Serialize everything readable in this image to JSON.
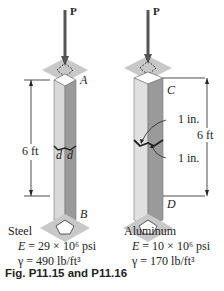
{
  "figure": {
    "caption": "Fig. P11.15 and P11.16",
    "colors": {
      "plate": "#c8c8c8",
      "column_light": "#d9d9d9",
      "column_dark": "#9a9a9a",
      "line": "#222222"
    }
  },
  "steel_column": {
    "load_label": "P",
    "top_point": "A",
    "bottom_point": "B",
    "length_label": "6 ft",
    "dimension_left": "d",
    "dimension_right": "d",
    "material": "Steel",
    "E_symbol": "E",
    "E_value": "= 29 × 10⁶ psi",
    "gamma_symbol": "γ",
    "gamma_value": "= 490 lb/ft³"
  },
  "aluminum_column": {
    "load_label": "P",
    "top_point": "C",
    "bottom_point": "D",
    "length_label": "6 ft",
    "dim_top": "1 in.",
    "dim_bottom": "1 in.",
    "material": "Aluminum",
    "E_symbol": "E",
    "E_value": "= 10 × 10⁶ psi",
    "gamma_symbol": "γ",
    "gamma_value": "= 170 lb/ft³"
  }
}
